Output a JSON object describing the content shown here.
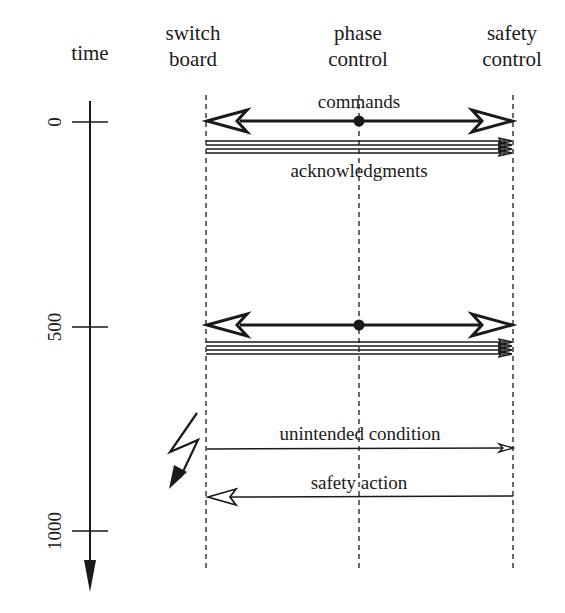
{
  "diagram": {
    "type": "sequence-timing",
    "colors": {
      "ink": "#1a1a1a",
      "background": "#ffffff"
    },
    "time_axis": {
      "label": "time",
      "ticks": [
        {
          "value": "0"
        },
        {
          "value": "500"
        },
        {
          "value": "1000"
        }
      ]
    },
    "participants": [
      {
        "line1": "switch",
        "line2": "board"
      },
      {
        "line1": "phase",
        "line2": "control"
      },
      {
        "line1": "safety",
        "line2": "control"
      }
    ],
    "messages": [
      {
        "label": "commands",
        "from": "phase control",
        "to": "switch board, safety control",
        "time": "0",
        "style": "bidirectional-open-arrow"
      },
      {
        "label": "acknowledgments",
        "from": "switch board",
        "to": "safety control",
        "time": "0",
        "style": "multi-line"
      },
      {
        "label": "",
        "from": "phase control",
        "to": "switch board, safety control",
        "time": "500",
        "style": "bidirectional-open-arrow"
      },
      {
        "label": "",
        "from": "switch board",
        "to": "safety control",
        "time": "500",
        "style": "multi-line"
      },
      {
        "label": "unintended condition",
        "from": "switch board",
        "to": "safety control",
        "style": "thin-arrow"
      },
      {
        "label": "safety action",
        "from": "safety control",
        "to": "switch board",
        "style": "thin-open-arrow"
      }
    ],
    "fault_icon": "lightning-bolt-icon"
  }
}
